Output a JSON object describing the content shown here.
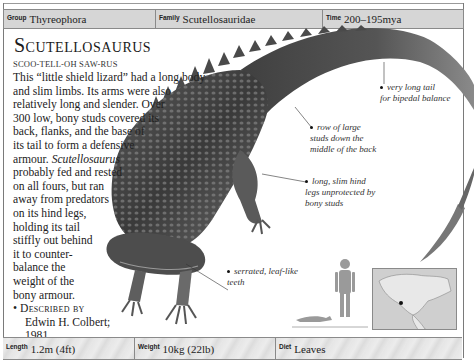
{
  "header": {
    "group": {
      "label": "Group",
      "value": "Thyreophora"
    },
    "family": {
      "label": "Family",
      "value": "Scutellosauridae"
    },
    "time": {
      "label": "Time",
      "value": "200–195mya"
    }
  },
  "title": "Scutellosaurus",
  "pronunciation": "SCOO-TELL-OH SAW-RUS",
  "description": {
    "lines": [
      "This “little shield lizard” had a long body",
      "and slim limbs. Its arms were also",
      "relatively long and slender. Over",
      "300 low, bony studs covered its",
      "back, flanks, and the base of",
      "its tail to form a defensive",
      "armour.",
      "probably fed and rested",
      "on all fours, but ran",
      "away from predators",
      "on its hind legs,",
      "holding its tail",
      "stiffly out behind",
      "it to counter-",
      "balance the",
      "weight of the",
      "bony armour."
    ],
    "italic_name": "Scutellosaurus"
  },
  "facts": {
    "described_by": {
      "label": "Described by",
      "value_line1": "Edwin H. Colbert;",
      "value_line2": "1981."
    },
    "habitat": {
      "label": "Habitat",
      "value": "Woodland."
    }
  },
  "annotations": [
    {
      "id": "tail",
      "line1": "very long tail",
      "line2": "for bipedal balance"
    },
    {
      "id": "studs",
      "line1": "row of large",
      "line2": "studs down the",
      "line3": "middle of the back"
    },
    {
      "id": "legs",
      "line1": "long, slim hind",
      "line2": "legs unprotected by",
      "line3": "bony studs"
    },
    {
      "id": "teeth",
      "line1": "serrated, leaf-like",
      "line2": "teeth"
    }
  ],
  "footer": {
    "length": {
      "label": "Length",
      "value": "1.2m (4ft)"
    },
    "weight": {
      "label": "Weight",
      "value": "10kg (22lb)"
    },
    "diet": {
      "label": "Diet",
      "value": "Leaves"
    }
  },
  "colors": {
    "header_bg": "#d6d6d6",
    "border": "#8a8a8a",
    "text": "#1a1a1a"
  }
}
